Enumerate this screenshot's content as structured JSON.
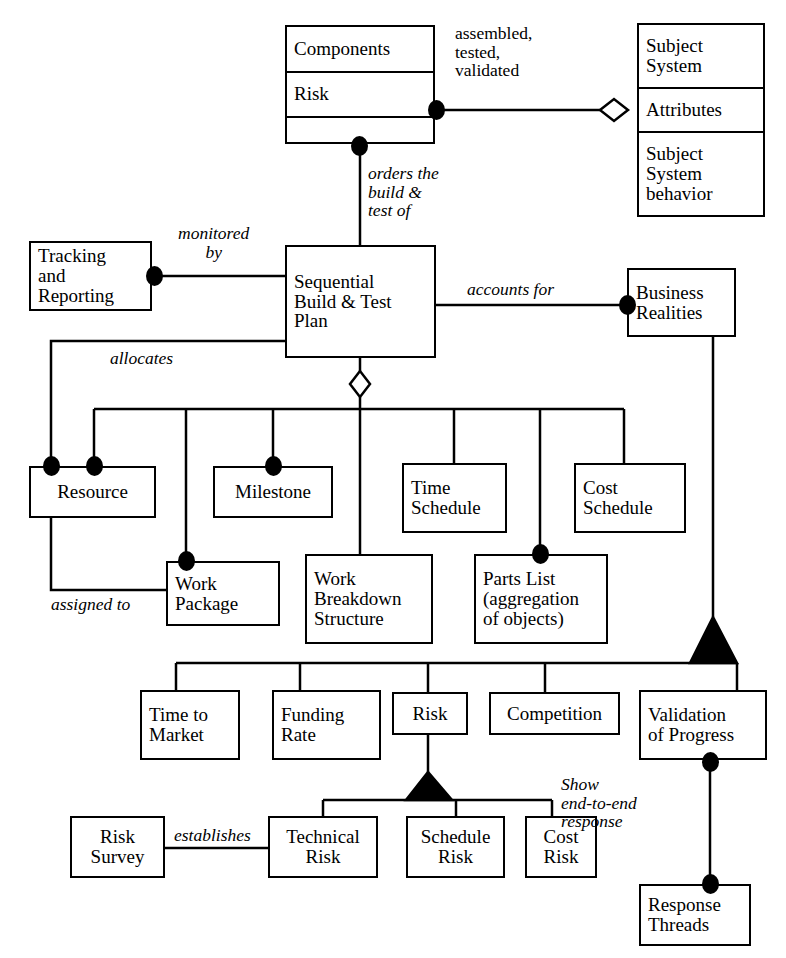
{
  "diagram": {
    "classes": [
      {
        "id": "components",
        "compartments": [
          "Components",
          "Risk",
          ""
        ],
        "x": 285,
        "y": 25,
        "w": 150,
        "h": 119
      },
      {
        "id": "subject-system",
        "compartments": [
          "Subject\nSystem",
          "Attributes",
          "Subject\nSystem\nbehavior"
        ],
        "x": 637,
        "y": 23,
        "w": 128,
        "h": 194
      },
      {
        "id": "tracking-and-reporting",
        "compartments": [
          "Tracking\nand\nReporting"
        ],
        "x": 29,
        "y": 241,
        "w": 123,
        "h": 70
      },
      {
        "id": "sequential-build-test-plan",
        "compartments": [
          "Sequential\nBuild & Test\nPlan"
        ],
        "x": 285,
        "y": 245,
        "w": 151,
        "h": 113
      },
      {
        "id": "business-realities",
        "compartments": [
          "Business\nRealities"
        ],
        "x": 627,
        "y": 268,
        "w": 109,
        "h": 69
      },
      {
        "id": "resource",
        "compartments": [
          "Resource"
        ],
        "x": 29,
        "y": 466,
        "w": 127,
        "h": 52
      },
      {
        "id": "milestone",
        "compartments": [
          "Milestone"
        ],
        "x": 213,
        "y": 466,
        "w": 120,
        "h": 52
      },
      {
        "id": "time-schedule",
        "compartments": [
          "Time\nSchedule"
        ],
        "x": 402,
        "y": 463,
        "w": 105,
        "h": 70
      },
      {
        "id": "cost-schedule",
        "compartments": [
          "Cost\nSchedule"
        ],
        "x": 574,
        "y": 463,
        "w": 112,
        "h": 70
      },
      {
        "id": "work-package",
        "compartments": [
          "Work\nPackage"
        ],
        "x": 166,
        "y": 561,
        "w": 114,
        "h": 65
      },
      {
        "id": "work-breakdown-structure",
        "compartments": [
          "Work\nBreakdown\nStructure"
        ],
        "x": 305,
        "y": 554,
        "w": 128,
        "h": 90
      },
      {
        "id": "parts-list",
        "compartments": [
          "Parts List\n(aggregation\nof objects)"
        ],
        "x": 474,
        "y": 554,
        "w": 134,
        "h": 90
      },
      {
        "id": "time-to-market",
        "compartments": [
          "Time to\nMarket"
        ],
        "x": 140,
        "y": 690,
        "w": 100,
        "h": 70
      },
      {
        "id": "funding-rate",
        "compartments": [
          "Funding\nRate"
        ],
        "x": 272,
        "y": 690,
        "w": 109,
        "h": 70
      },
      {
        "id": "risk-attribute",
        "compartments": [
          "Risk"
        ],
        "x": 392,
        "y": 692,
        "w": 76,
        "h": 43
      },
      {
        "id": "competition",
        "compartments": [
          "Competition"
        ],
        "x": 489,
        "y": 692,
        "w": 131,
        "h": 43
      },
      {
        "id": "validation-of-progress",
        "compartments": [
          "Validation\nof Progress"
        ],
        "x": 639,
        "y": 690,
        "w": 128,
        "h": 70
      },
      {
        "id": "risk-survey",
        "compartments": [
          "Risk\nSurvey"
        ],
        "x": 70,
        "y": 816,
        "w": 95,
        "h": 62
      },
      {
        "id": "technical-risk",
        "compartments": [
          "Technical\nRisk"
        ],
        "x": 268,
        "y": 816,
        "w": 110,
        "h": 62
      },
      {
        "id": "schedule-risk",
        "compartments": [
          "Schedule\nRisk"
        ],
        "x": 406,
        "y": 816,
        "w": 99,
        "h": 62
      },
      {
        "id": "cost-risk",
        "compartments": [
          "Cost\nRisk"
        ],
        "x": 525,
        "y": 816,
        "w": 72,
        "h": 62
      },
      {
        "id": "response-threads",
        "compartments": [
          "Response\nThreads"
        ],
        "x": 639,
        "y": 884,
        "w": 112,
        "h": 62
      }
    ],
    "relationship_labels": [
      {
        "id": "assembled-tested-validated",
        "text": "assembled,\ntested,\nvalidated",
        "x": 455,
        "y": 24,
        "italic": false
      },
      {
        "id": "orders-the-build-test-of",
        "text": "orders the\nbuild &\ntest of",
        "x": 368,
        "y": 164,
        "italic": true,
        "mixed": true
      },
      {
        "id": "monitored-by",
        "text": "monitored\nby",
        "x": 178,
        "y": 224,
        "italic": true
      },
      {
        "id": "accounts-for",
        "text": "accounts for",
        "x": 467,
        "y": 280,
        "italic": true
      },
      {
        "id": "allocates",
        "text": "allocates",
        "x": 110,
        "y": 349,
        "italic": true
      },
      {
        "id": "assigned-to",
        "text": "assigned to",
        "x": 51,
        "y": 595,
        "italic": true
      },
      {
        "id": "establishes",
        "text": "establishes",
        "x": 174,
        "y": 826,
        "italic": true
      },
      {
        "id": "show-end-to-end-response",
        "text": "Show\nend-to-end\nresponse",
        "x": 561,
        "y": 775,
        "italic": true,
        "mixed": true
      }
    ]
  }
}
